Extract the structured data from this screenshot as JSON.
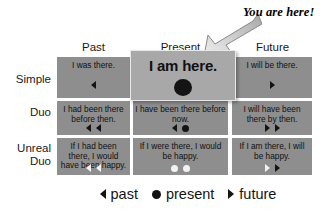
{
  "callout": {
    "text": "You are here!",
    "arrow_icon": "arrow-down-left-icon"
  },
  "table": {
    "column_headers": [
      "Past",
      "Present",
      "Future"
    ],
    "row_headers": [
      "Simple",
      "Duo",
      "Unreal Duo"
    ],
    "cells": [
      [
        {
          "text": "I was there.",
          "markers": [
            "past"
          ]
        },
        {
          "text": "I am here.",
          "markers": [
            "present"
          ]
        },
        {
          "text": "I will be there.",
          "markers": [
            "future"
          ]
        }
      ],
      [
        {
          "text": "I had been there before then.",
          "markers": [
            "past",
            "past"
          ]
        },
        {
          "text": "I have been there before now.",
          "markers": [
            "past",
            "present"
          ]
        },
        {
          "text": "I will have been there by then.",
          "markers": [
            "future",
            "future"
          ]
        }
      ],
      [
        {
          "text": "If I had been there, I would have been happy.",
          "markers": [
            "past-hollow",
            "past-hollow"
          ]
        },
        {
          "text": "If I were there, I would be happy.",
          "markers": [
            "present-hollow",
            "present-hollow"
          ]
        },
        {
          "text": "If I am there, I will be happy.",
          "markers": [
            "future-hollow",
            "future"
          ]
        }
      ]
    ]
  },
  "highlight": {
    "text": "I am here.",
    "marker": "present"
  },
  "legend": [
    {
      "marker": "past",
      "label": "past"
    },
    {
      "marker": "present",
      "label": "present"
    },
    {
      "marker": "future",
      "label": "future"
    }
  ],
  "colors": {
    "cell_background": "#8e8e8e",
    "highlight_background": "#a8a8a8",
    "marker_dark": "#141414",
    "marker_light": "#f2f2f2",
    "page_background": "#ffffff"
  }
}
